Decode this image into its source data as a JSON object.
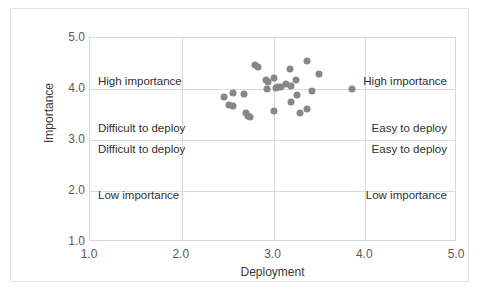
{
  "chart_data": {
    "type": "scatter",
    "title": "",
    "xlabel": "Deployment",
    "ylabel": "Importance",
    "xlim": [
      1.0,
      5.0
    ],
    "ylim": [
      1.0,
      5.0
    ],
    "xticks": [
      "1.0",
      "2.0",
      "3.0",
      "4.0",
      "5.0"
    ],
    "yticks": [
      "1.0",
      "2.0",
      "3.0",
      "4.0",
      "5.0"
    ],
    "xtick_values": [
      1.0,
      2.0,
      3.0,
      4.0,
      5.0
    ],
    "ytick_values": [
      1.0,
      2.0,
      3.0,
      4.0,
      5.0
    ],
    "grid": true,
    "legend": "none",
    "marker_color": "#878787",
    "series": [
      {
        "name": "items",
        "points": [
          {
            "x": 2.46,
            "y": 3.85
          },
          {
            "x": 2.52,
            "y": 3.69
          },
          {
            "x": 2.56,
            "y": 3.93
          },
          {
            "x": 2.56,
            "y": 3.67
          },
          {
            "x": 2.68,
            "y": 3.91
          },
          {
            "x": 2.7,
            "y": 3.53
          },
          {
            "x": 2.72,
            "y": 3.47
          },
          {
            "x": 2.74,
            "y": 3.45
          },
          {
            "x": 2.8,
            "y": 4.47
          },
          {
            "x": 2.83,
            "y": 4.44
          },
          {
            "x": 2.92,
            "y": 4.18
          },
          {
            "x": 2.94,
            "y": 4.14
          },
          {
            "x": 2.93,
            "y": 4.0
          },
          {
            "x": 3.01,
            "y": 4.22
          },
          {
            "x": 3.03,
            "y": 4.01
          },
          {
            "x": 3.05,
            "y": 4.04
          },
          {
            "x": 3.08,
            "y": 4.03
          },
          {
            "x": 3.0,
            "y": 3.56
          },
          {
            "x": 3.14,
            "y": 4.1
          },
          {
            "x": 3.18,
            "y": 4.4
          },
          {
            "x": 3.19,
            "y": 4.06
          },
          {
            "x": 3.19,
            "y": 3.75
          },
          {
            "x": 3.25,
            "y": 4.17
          },
          {
            "x": 3.26,
            "y": 3.88
          },
          {
            "x": 3.29,
            "y": 3.52
          },
          {
            "x": 3.37,
            "y": 4.55
          },
          {
            "x": 3.36,
            "y": 3.61
          },
          {
            "x": 3.42,
            "y": 3.96
          },
          {
            "x": 3.5,
            "y": 4.29
          },
          {
            "x": 3.86,
            "y": 4.0
          }
        ]
      }
    ],
    "annotations": [
      {
        "position": "top-left",
        "lines": [
          "High importance",
          "Difficult to deploy"
        ]
      },
      {
        "position": "top-right",
        "lines": [
          "High importance",
          "Easy to deploy"
        ]
      },
      {
        "position": "bottom-left",
        "lines": [
          "Difficult to deploy",
          "Low importance"
        ]
      },
      {
        "position": "bottom-right",
        "lines": [
          "Easy to deploy",
          "Low importance"
        ]
      }
    ]
  },
  "axes": {
    "x_label": "Deployment",
    "y_label": "Importance",
    "x_ticks": [
      "1.0",
      "2.0",
      "3.0",
      "4.0",
      "5.0"
    ],
    "y_ticks": [
      "1.0",
      "2.0",
      "3.0",
      "4.0",
      "5.0"
    ]
  },
  "quadrants": {
    "top_left": {
      "line1": "High importance",
      "line2": "Difficult to deploy"
    },
    "top_right": {
      "line1": "High importance",
      "line2": "Easy to deploy"
    },
    "bottom_left": {
      "line1": "Difficult to deploy",
      "line2": "Low importance"
    },
    "bottom_right": {
      "line1": "Easy to deploy",
      "line2": "Low importance"
    }
  },
  "colors": {
    "marker": "#878787",
    "grid": "#d9d9d9",
    "frame": "#e4e4e4",
    "tick_text": "#5a5a5a",
    "label_text": "#3a3a3a",
    "annotation_text": "#2f2f2f"
  }
}
